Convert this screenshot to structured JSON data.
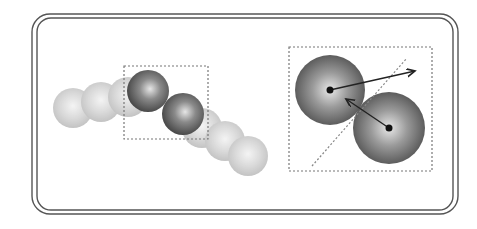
{
  "diagram": {
    "title": "",
    "colors": {
      "frame": "#555555",
      "dashed": "#777777",
      "ghost_sphere": "#bdbdbd",
      "solid_sphere_dark": "#5a5a5a",
      "solid_sphere_light": "#d8d8d8",
      "arrow": "#222222",
      "center_dot": "#111111"
    },
    "left_panel": {
      "ghost_spheres": [
        {
          "cx": 73,
          "cy": 108,
          "r": 20
        },
        {
          "cx": 101,
          "cy": 102,
          "r": 20
        },
        {
          "cx": 128,
          "cy": 97,
          "r": 20
        },
        {
          "cx": 202,
          "cy": 128,
          "r": 20
        },
        {
          "cx": 225,
          "cy": 141,
          "r": 20
        },
        {
          "cx": 248,
          "cy": 156,
          "r": 20
        }
      ],
      "solid_spheres": [
        {
          "cx": 148,
          "cy": 91,
          "r": 21
        },
        {
          "cx": 183,
          "cy": 114,
          "r": 21
        }
      ],
      "inset_box": {
        "x": 124,
        "y": 66,
        "w": 84,
        "h": 73
      }
    },
    "right_panel": {
      "inset_box": {
        "x": 289,
        "y": 47,
        "w": 143,
        "h": 124
      },
      "spheres": [
        {
          "cx": 330,
          "cy": 90,
          "r": 35
        },
        {
          "cx": 389,
          "cy": 128,
          "r": 36
        }
      ],
      "contact_plane": {
        "x1": 312,
        "y1": 166,
        "x2": 407,
        "y2": 58
      },
      "arrows": [
        {
          "name": "outgoing-velocity",
          "x1": 330,
          "y1": 90,
          "x2": 416,
          "y2": 71
        },
        {
          "name": "incoming-velocity",
          "x1": 389,
          "y1": 128,
          "x2": 344,
          "y2": 98
        }
      ]
    },
    "frame": {
      "outer": {
        "x": 32,
        "y": 14,
        "w": 426,
        "h": 200,
        "r": 18
      },
      "inner": {
        "x": 37,
        "y": 18,
        "w": 416,
        "h": 192,
        "r": 14
      }
    }
  }
}
